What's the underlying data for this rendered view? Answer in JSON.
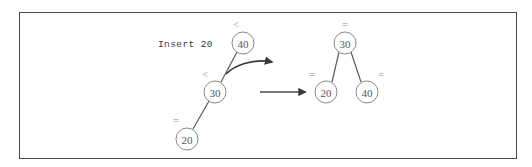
{
  "figure": {
    "caption": "Insert 20",
    "border_color": "#4a4a4a",
    "background_color": "#ffffff",
    "node_stroke_color": "#8a8a8a",
    "edge_color": "#5a5a5a",
    "arrow_color": "#3a3a3a"
  },
  "before_tree": {
    "name": "unbalanced-tree",
    "nodes": [
      {
        "id": "n40",
        "label": "40",
        "balance": "<",
        "cx": 243,
        "cy": 43,
        "r": 11,
        "bx": 236,
        "by": 24
      },
      {
        "id": "n30",
        "label": "30",
        "balance": "<",
        "cx": 215,
        "cy": 92,
        "r": 11,
        "bx": 205,
        "by": 74
      },
      {
        "id": "n20",
        "label": "20",
        "balance": "=",
        "cx": 187,
        "cy": 139,
        "r": 11,
        "bx": 176,
        "by": 120
      }
    ],
    "edges": [
      {
        "from": "n40",
        "to": "n30",
        "x1": 237,
        "y1": 52,
        "x2": 221,
        "y2": 82
      },
      {
        "from": "n30",
        "to": "n20",
        "x1": 209,
        "y1": 101,
        "x2": 193,
        "y2": 129
      }
    ]
  },
  "after_tree": {
    "name": "balanced-tree",
    "nodes": [
      {
        "id": "b30",
        "label": "30",
        "balance": "=",
        "cx": 345,
        "cy": 43,
        "r": 11,
        "bx": 345,
        "by": 24
      },
      {
        "id": "b20",
        "label": "20",
        "balance": "=",
        "cx": 326,
        "cy": 92,
        "r": 11,
        "bx": 312,
        "by": 74
      },
      {
        "id": "b40",
        "label": "40",
        "balance": "=",
        "cx": 367,
        "cy": 92,
        "r": 11,
        "bx": 381,
        "by": 74
      }
    ],
    "edges": [
      {
        "from": "b30",
        "to": "b20",
        "x1": 339,
        "y1": 52,
        "x2": 332,
        "y2": 82
      },
      {
        "from": "b30",
        "to": "b40",
        "x1": 351,
        "y1": 52,
        "x2": 361,
        "y2": 82
      }
    ]
  },
  "transform_arrow": {
    "name": "transformation-arrow",
    "label": "",
    "x1": 260,
    "y1": 92,
    "x2": 308,
    "y2": 92
  },
  "rotation_arrow": {
    "name": "rotation-arrow",
    "label": "",
    "path": "M 226 74 C 234 66 252 58 272 62"
  },
  "caption_position": {
    "x": 158,
    "y": 44
  }
}
